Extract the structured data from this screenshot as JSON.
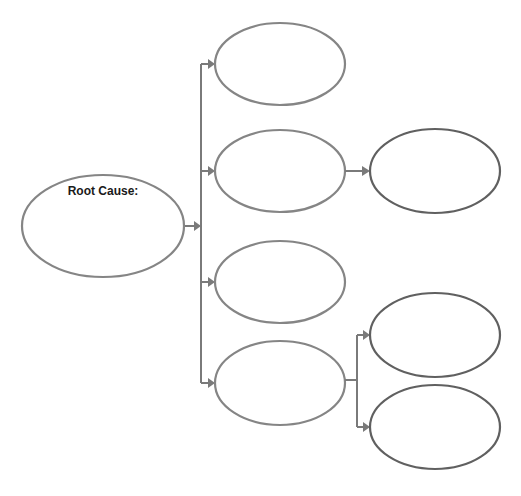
{
  "diagram": {
    "type": "cause-effect tree",
    "colors": {
      "background": "#ffffff",
      "ellipse_stroke": "#808080",
      "ellipse_stroke_dark": "#606060",
      "connector": "#7a7a7a",
      "text": "#1a1a1a"
    },
    "root": {
      "label": "Root Cause:",
      "content": ""
    },
    "level1": [
      {
        "label": ""
      },
      {
        "label": ""
      },
      {
        "label": ""
      },
      {
        "label": ""
      }
    ],
    "level2": [
      {
        "parent": 1,
        "label": ""
      },
      {
        "parent": 3,
        "label": ""
      },
      {
        "parent": 3,
        "label": ""
      }
    ]
  }
}
